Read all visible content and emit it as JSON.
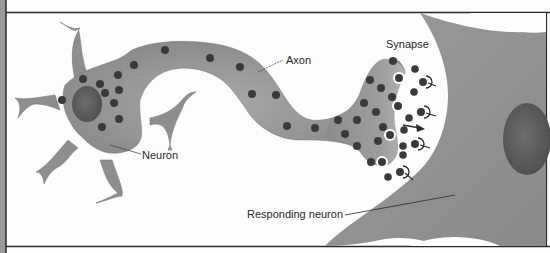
{
  "diagram": {
    "labels": {
      "neuron": "Neuron",
      "axon": "Axon",
      "synapse": "Synapse",
      "responding_neuron": "Responding neuron"
    },
    "colors": {
      "cell_fill": "#8e8e8e",
      "cell_fill_light": "#a6a6a6",
      "nucleus": "#5e5e5e",
      "vesicle": "#3a3a3a",
      "frame": "#2b2b2b",
      "side_strip": "#9a9a9a",
      "background": "#fdfdfd"
    },
    "components": [
      "sending neuron cell body with nucleus",
      "dendrites",
      "axon with vesicles",
      "axon terminal",
      "synaptic cleft with neurotransmitters",
      "receptors on responding neuron",
      "responding neuron with nucleus",
      "arrow showing direction of transmission"
    ]
  }
}
